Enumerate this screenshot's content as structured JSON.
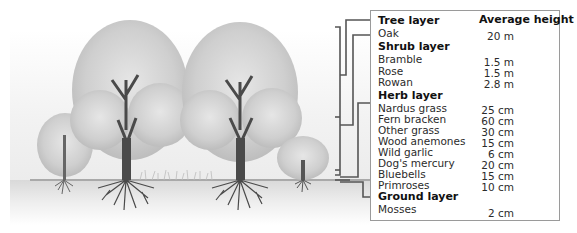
{
  "table": {
    "column_header": "Average height",
    "layers": [
      {
        "name": "Tree layer",
        "plants": [
          {
            "name": "Oak",
            "height": "20 m"
          }
        ]
      },
      {
        "name": "Shrub layer",
        "plants": [
          {
            "name": "Bramble",
            "height": "1.5 m"
          },
          {
            "name": "Rose",
            "height": "1.5 m"
          },
          {
            "name": "Rowan",
            "height": "2.8 m"
          }
        ]
      },
      {
        "name": "Herb layer",
        "plants": [
          {
            "name": "Nardus grass",
            "height": "25 cm"
          },
          {
            "name": "Fern bracken",
            "height": "60 cm"
          },
          {
            "name": "Other grass",
            "height": "30 cm"
          },
          {
            "name": "Wood anemones",
            "height": "15 cm"
          },
          {
            "name": "Wild garlic",
            "height": "6 cm"
          },
          {
            "name": "Dog's mercury",
            "height": "20 cm"
          },
          {
            "name": "Bluebells",
            "height": "15 cm"
          },
          {
            "name": "Primroses",
            "height": "10 cm"
          }
        ]
      },
      {
        "name": "Ground layer",
        "plants": [
          {
            "name": "Mosses",
            "height": "2 cm"
          }
        ]
      }
    ]
  },
  "illustration": {
    "trees": [
      "small-tree-left",
      "large-oak-1",
      "large-oak-2",
      "small-tree-right"
    ],
    "colors": {
      "foliage": "#c8c8c8",
      "trunk": "#555555",
      "connector": "#555555",
      "border": "#9a9a9a"
    }
  }
}
